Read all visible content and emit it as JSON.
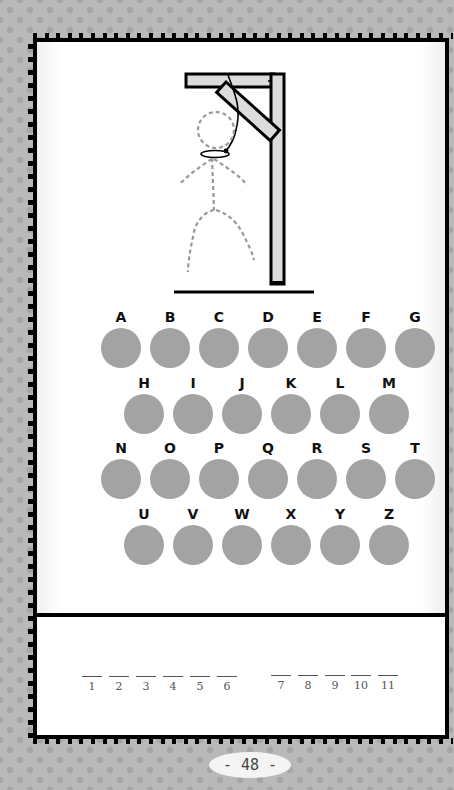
{
  "game": {
    "title": "Hangman",
    "drawing": {
      "gallows": "wooden-gallows",
      "figure": "dashed-stick-figure-outline",
      "rope": "noose"
    },
    "alphabet_rows": [
      [
        "A",
        "B",
        "C",
        "D",
        "E",
        "F",
        "G"
      ],
      [
        "H",
        "I",
        "J",
        "K",
        "L",
        "M"
      ],
      [
        "N",
        "O",
        "P",
        "Q",
        "R",
        "S",
        "T"
      ],
      [
        "U",
        "V",
        "W",
        "X",
        "Y",
        "Z"
      ]
    ],
    "letters": {
      "A": "A",
      "B": "B",
      "C": "C",
      "D": "D",
      "E": "E",
      "F": "F",
      "G": "G",
      "H": "H",
      "I": "I",
      "J": "J",
      "K": "K",
      "L": "L",
      "M": "M",
      "N": "N",
      "O": "O",
      "P": "P",
      "Q": "Q",
      "R": "R",
      "S": "S",
      "T": "T",
      "U": "U",
      "V": "V",
      "W": "W",
      "X": "X",
      "Y": "Y",
      "Z": "Z"
    },
    "answer": {
      "words": [
        {
          "blanks": [
            "1",
            "2",
            "3",
            "4",
            "5",
            "6"
          ]
        },
        {
          "blanks": [
            "7",
            "8",
            "9",
            "10",
            "11"
          ]
        }
      ]
    },
    "colors": {
      "circle": "#a3a3a3",
      "border": "#000000",
      "background": "#b9b9b9",
      "figure_dash": "#9a9a9a",
      "wood": "#dcdcdc"
    }
  },
  "page": {
    "number": "- 48 -"
  }
}
